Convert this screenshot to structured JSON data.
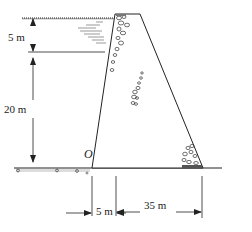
{
  "diagram": {
    "type": "gravity dam cross-section",
    "labels": {
      "water_depth_top": "5 m",
      "water_depth_bottom": "20 m",
      "origin": "O",
      "base_left": "5 m",
      "base_right": "35 m"
    },
    "colors": {
      "line": "#222222",
      "background": "#ffffff"
    }
  }
}
